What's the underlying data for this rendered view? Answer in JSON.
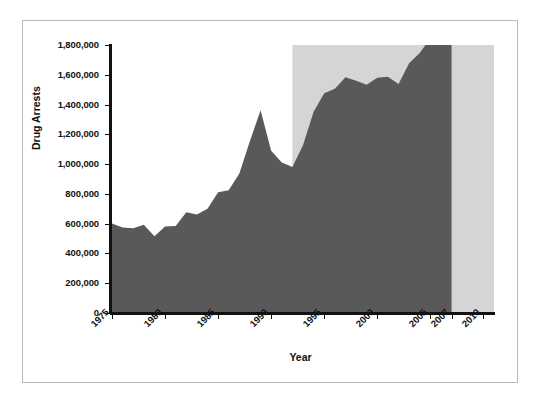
{
  "chart_data": {
    "type": "area",
    "title": "",
    "subtitle": "",
    "xlabel": "Year",
    "ylabel": "Drug Arrests",
    "xlim": [
      1975,
      2011
    ],
    "ylim": [
      0,
      1800000
    ],
    "grid": false,
    "legend": null,
    "x_tick_labels": [
      "1975",
      "1980",
      "1985",
      "1990",
      "1995",
      "2000",
      "2005",
      "2007",
      "2010"
    ],
    "x_tick_values": [
      1975,
      1980,
      1985,
      1990,
      1995,
      2000,
      2005,
      2007,
      2010
    ],
    "y_tick_labels": [
      "0",
      "200,000",
      "400,000",
      "600,000",
      "800,000",
      "1,000,000",
      "1,200,000",
      "1,400,000",
      "1,600,000",
      "1,800,000"
    ],
    "y_tick_values": [
      0,
      200000,
      400000,
      600000,
      800000,
      1000000,
      1200000,
      1400000,
      1600000,
      1800000
    ],
    "series": [
      {
        "name": "Drug Arrests",
        "color": "#595959",
        "x": [
          1975,
          1976,
          1977,
          1978,
          1979,
          1980,
          1981,
          1982,
          1983,
          1984,
          1985,
          1986,
          1987,
          1988,
          1989,
          1990,
          1991,
          1992,
          1993,
          1994,
          1995,
          1996,
          1997,
          1998,
          1999,
          2000,
          2001,
          2002,
          2003,
          2004,
          2005,
          2006,
          2007
        ],
        "values": [
          601400,
          575000,
          569000,
          592000,
          516000,
          580900,
          584000,
          676000,
          662000,
          700000,
          811400,
          824000,
          937400,
          1155200,
          1361700,
          1089500,
          1010000,
          980000,
          1126300,
          1351400,
          1476100,
          1506200,
          1583600,
          1559100,
          1532200,
          1579566,
          1586902,
          1538813,
          1678192,
          1745712,
          1846351,
          1889810,
          1841182
        ]
      }
    ],
    "shaded_region": {
      "label": "",
      "color": "#d5d5d5",
      "x_start": 1992,
      "x_end": 2011,
      "y_top": 1800000
    },
    "colors": {
      "area_fill": "#595959",
      "shaded_band": "#d5d5d5",
      "axis": "#111111",
      "frame_border": "#b9b9b9",
      "background": "#ffffff"
    }
  },
  "axes": {
    "y_title": "Drug Arrests",
    "x_title": "Year"
  }
}
